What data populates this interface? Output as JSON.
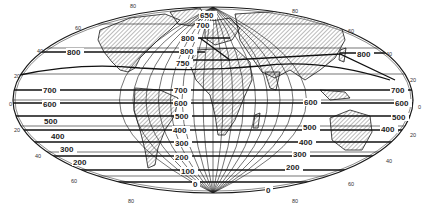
{
  "figure": {
    "type": "world-map-isolines",
    "projection": "elliptical (Mollweide-like)",
    "colors": {
      "ink": "#1a1a1a",
      "background": "#ffffff",
      "land_hatch": "#555555"
    },
    "latitude_labels": {
      "left": [
        "80",
        "60",
        "40",
        "20",
        "0",
        "20",
        "40",
        "60",
        "80"
      ],
      "right": [
        "80",
        "60",
        "40",
        "20",
        "0",
        "20",
        "40",
        "60",
        "80"
      ]
    },
    "isoline_labels": {
      "central_column": [
        "650",
        "700",
        "800",
        "800",
        "750",
        "700",
        "600",
        "500",
        "400",
        "300",
        "200",
        "100",
        "0"
      ],
      "left_column": [
        "800",
        "700",
        "600",
        "500",
        "400",
        "300",
        "200"
      ],
      "atlantic_column": [
        "700",
        "600",
        "500",
        "400",
        "300",
        "200",
        "100",
        "0"
      ],
      "indian_column": [
        "600",
        "500",
        "400",
        "300",
        "200",
        "0"
      ],
      "pacific_right": [
        "800",
        "700",
        "600",
        "500",
        "400"
      ]
    },
    "caption_text": ""
  }
}
